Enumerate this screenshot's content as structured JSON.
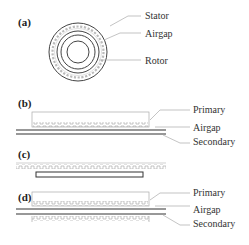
{
  "figure": {
    "panels": [
      {
        "id": "a",
        "label": "(a)",
        "type": "rotary",
        "parts": [
          "Stator",
          "Airgap",
          "Rotor"
        ]
      },
      {
        "id": "b",
        "label": "(b)",
        "type": "single-sided linear",
        "parts": [
          "Primary",
          "Airgap",
          "Secondary"
        ]
      },
      {
        "id": "c",
        "label": "(c)",
        "type": "linear short-secondary",
        "parts": []
      },
      {
        "id": "d",
        "label": "(d)",
        "type": "double-sided linear",
        "parts": [
          "Primary",
          "Airgap",
          "Secondary"
        ]
      }
    ]
  },
  "colors": {
    "stroke_dark": "#333333",
    "stroke_light": "#999999",
    "leader": "#aaaaaa"
  }
}
